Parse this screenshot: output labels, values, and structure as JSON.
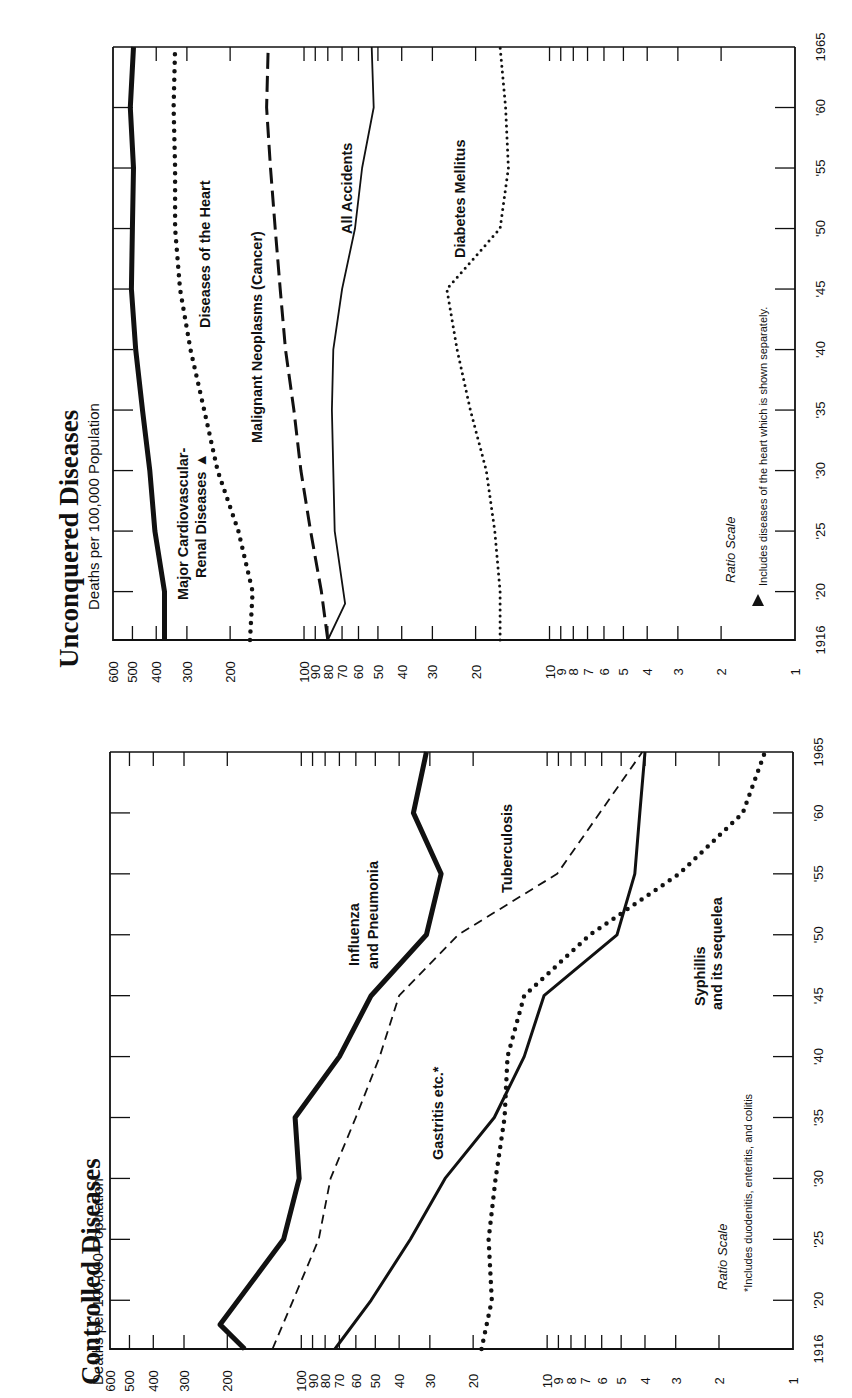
{
  "page": {
    "orientation": "rotated 90° counter-clockwise",
    "background": "#ffffff",
    "ink": "#111111"
  },
  "chart_data": [
    {
      "type": "line",
      "title": "Controlled Diseases",
      "subtitle": "Deaths per 100,000 Population",
      "xlabel": "",
      "ylabel": "Deaths per 100,000 Population",
      "scale_note": "Ratio Scale",
      "footnote": "*Includes duodenitis, enteritis, and colitis",
      "x": [
        1916,
        1920,
        1925,
        1930,
        1935,
        1940,
        1945,
        1950,
        1955,
        1960,
        1965
      ],
      "x_tick_labels": [
        "1916",
        "'20",
        "'25",
        "'30",
        "'35",
        "'40",
        "'45",
        "'50",
        "'55",
        "'60",
        "1965"
      ],
      "y_scale": "log",
      "ylim": [
        1,
        600
      ],
      "y_tick_labels": [
        "600",
        "500",
        "400",
        "300",
        "200",
        "100",
        "90",
        "80",
        "70",
        "60",
        "50",
        "40",
        "30",
        "20",
        "10",
        "9",
        "8",
        "7",
        "6",
        "5",
        "4",
        "3",
        "2",
        "1"
      ],
      "y_tick_values": [
        600,
        500,
        400,
        300,
        200,
        100,
        90,
        80,
        70,
        60,
        50,
        40,
        30,
        20,
        10,
        9,
        8,
        7,
        6,
        5,
        4,
        3,
        2,
        1
      ],
      "grid": false,
      "legend": "inline labels",
      "series": [
        {
          "name": "Influenza and Pneumonia",
          "label_lines": [
            "Influenza",
            "and Pneumonia"
          ],
          "style": "thick-solid",
          "x": [
            1916,
            1918,
            1925,
            1930,
            1935,
            1940,
            1945,
            1950,
            1955,
            1960,
            1965
          ],
          "values": [
            170,
            214,
            118,
            102,
            106,
            70,
            52,
            31,
            27,
            35,
            31
          ]
        },
        {
          "name": "Tuberculosis",
          "label_lines": [
            "Tuberculosis"
          ],
          "style": "dashed",
          "x": [
            1916,
            1920,
            1925,
            1930,
            1935,
            1940,
            1945,
            1950,
            1955,
            1965
          ],
          "values": [
            131,
            108,
            85,
            76,
            60,
            48,
            40,
            23,
            9.1,
            4.1
          ]
        },
        {
          "name": "Gastritis etc.*",
          "label_lines": [
            "Gastritis etc.*"
          ],
          "style": "solid",
          "x": [
            1916,
            1920,
            1925,
            1930,
            1935,
            1940,
            1945,
            1950,
            1955,
            1960,
            1965
          ],
          "values": [
            73,
            52,
            36,
            26,
            16.4,
            12.4,
            10.3,
            5.2,
            4.4,
            4.2,
            4.0
          ]
        },
        {
          "name": "Syphilis and its sequelea",
          "label_lines": [
            "Syphillis",
            "and its sequelea"
          ],
          "style": "dotted",
          "x": [
            1916,
            1920,
            1925,
            1930,
            1935,
            1940,
            1945,
            1950,
            1955,
            1960,
            1965
          ],
          "values": [
            18.5,
            16.8,
            17.3,
            16.2,
            14.9,
            14.5,
            12.4,
            6.7,
            2.9,
            1.6,
            1.3
          ]
        }
      ]
    },
    {
      "type": "line",
      "title": "Unconquered Diseases",
      "subtitle": "Deaths per 100,000 Population",
      "xlabel": "",
      "ylabel": "Deaths per 100,000 Population",
      "scale_note": "Ratio Scale",
      "footnote": "Includes diseases of the heart which is shown separately.",
      "footnote_marker": "▲",
      "x": [
        1916,
        1920,
        1925,
        1930,
        1935,
        1940,
        1945,
        1950,
        1955,
        1960,
        1965
      ],
      "x_tick_labels": [
        "1916",
        "'20",
        "'25",
        "'30",
        "'35",
        "'40",
        "'45",
        "'50",
        "'55",
        "'60",
        "1965"
      ],
      "y_scale": "log",
      "ylim": [
        1,
        600
      ],
      "y_tick_labels": [
        "600",
        "500",
        "400",
        "300",
        "200",
        "100",
        "90",
        "80",
        "70",
        "60",
        "50",
        "40",
        "30",
        "20",
        "10",
        "9",
        "8",
        "7",
        "6",
        "5",
        "4",
        "3",
        "2",
        "1"
      ],
      "y_tick_values": [
        600,
        500,
        400,
        300,
        200,
        100,
        90,
        80,
        70,
        60,
        50,
        40,
        30,
        20,
        10,
        9,
        8,
        7,
        6,
        5,
        4,
        3,
        2,
        1
      ],
      "grid": false,
      "legend": "inline labels",
      "series": [
        {
          "name": "Major Cardiovascular-Renal Diseases ▲",
          "label_lines": [
            "Major Cardiovascular-",
            "Renal Diseases ▲"
          ],
          "style": "thick-solid",
          "x": [
            1916,
            1920,
            1925,
            1930,
            1935,
            1940,
            1945,
            1950,
            1955,
            1960,
            1965
          ],
          "values": [
            370,
            370,
            405,
            425,
            455,
            485,
            505,
            500,
            495,
            510,
            495
          ]
        },
        {
          "name": "Diseases of the Heart",
          "label_lines": [
            "Diseases of the Heart"
          ],
          "style": "dotted",
          "x": [
            1916,
            1920,
            1925,
            1930,
            1935,
            1940,
            1945,
            1950,
            1955,
            1960,
            1965
          ],
          "values": [
            166,
            162,
            185,
            225,
            255,
            290,
            320,
            335,
            335,
            340,
            335
          ]
        },
        {
          "name": "Malignant Neoplasms (Cancer)",
          "label_lines": [
            "Malignant Neoplasms (Cancer)"
          ],
          "style": "long-dashed",
          "x": [
            1916,
            1920,
            1925,
            1930,
            1935,
            1940,
            1945,
            1950,
            1955,
            1960,
            1965
          ],
          "values": [
            80,
            85,
            94,
            103,
            110,
            119,
            125,
            131,
            137,
            142,
            140
          ]
        },
        {
          "name": "All Accidents",
          "label_lines": [
            "All Accidents"
          ],
          "style": "thin-solid",
          "x": [
            1916,
            1919,
            1925,
            1930,
            1935,
            1940,
            1945,
            1950,
            1955,
            1960,
            1965
          ],
          "values": [
            80,
            68,
            75,
            76,
            77,
            76,
            70,
            62,
            58,
            52,
            53
          ]
        },
        {
          "name": "Diabetes Mellitus",
          "label_lines": [
            "Diabetes Mellitus"
          ],
          "style": "dotted-fine",
          "x": [
            1916,
            1920,
            1925,
            1930,
            1935,
            1940,
            1945,
            1950,
            1955,
            1960,
            1965
          ],
          "values": [
            15.9,
            15.9,
            16.7,
            18.1,
            21.0,
            23.8,
            26.2,
            15.9,
            14.7,
            15.1,
            15.9
          ]
        }
      ]
    }
  ],
  "panels": [
    {
      "id": "controlled",
      "title": "Controlled Diseases",
      "subtitle": "Deaths per 100,000 Population",
      "ratio_scale": "Ratio Scale",
      "footnote": "*Includes duodenitis, enteritis, and colitis",
      "labels": {
        "influenza_1": "Influenza",
        "influenza_2": "and Pneumonia",
        "tuberculosis": "Tuberculosis",
        "gastritis": "Gastritis etc.*",
        "syphilis_1": "Syphillis",
        "syphilis_2": "and its sequelea"
      }
    },
    {
      "id": "unconquered",
      "title": "Unconquered Diseases",
      "subtitle": "Deaths per 100,000 Population",
      "ratio_scale": "Ratio Scale",
      "footnote": "Includes diseases of the heart which is shown separately.",
      "labels": {
        "cvr_1": "Major Cardiovascular-",
        "cvr_2": "Renal Diseases ▲",
        "heart": "Diseases of the Heart",
        "cancer": "Malignant Neoplasms (Cancer)",
        "accidents": "All Accidents",
        "diabetes": "Diabetes Mellitus"
      }
    }
  ]
}
